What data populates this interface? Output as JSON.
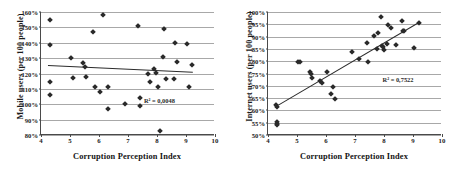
{
  "figure": {
    "panels": [
      {
        "id": "mobile",
        "ylabel": "Mobile users (per 100 people)",
        "xlabel": "Corruption Perception Index",
        "r2_label": "R² = 0,0048"
      },
      {
        "id": "internet",
        "ylabel": "Internet users (per 100 people)",
        "xlabel": "Corruption Perception Index",
        "r2_label": "R² = 0,7522"
      }
    ]
  },
  "chart_data": [
    {
      "type": "scatter",
      "title": "",
      "xlabel": "Corruption Perception Index",
      "ylabel": "Mobile users (per 100 people)",
      "xlim": [
        4,
        10
      ],
      "ylim": [
        0.8,
        1.6
      ],
      "xticks": [
        4,
        5,
        6,
        7,
        8,
        9,
        10
      ],
      "yticks": [
        0.8,
        0.9,
        1.0,
        1.1,
        1.2,
        1.3,
        1.4,
        1.5,
        1.6
      ],
      "ytick_labels": [
        "80%",
        "90%",
        "100%",
        "110%",
        "120%",
        "130%",
        "140%",
        "150%",
        "160%"
      ],
      "xtick_labels": [
        "4",
        "5",
        "6",
        "7",
        "8",
        "9",
        "10"
      ],
      "grid": "horizontal",
      "legend": "none",
      "annotations": [
        {
          "text": "R² = 0,0048",
          "x": 7.55,
          "y": 1.045
        }
      ],
      "trendline": {
        "type": "linear",
        "x": [
          4.25,
          9.25
        ],
        "y": [
          1.253,
          1.209
        ],
        "r2": 0.0048
      },
      "points": [
        {
          "x": 4.3,
          "y": 1.545
        },
        {
          "x": 4.3,
          "y": 1.385
        },
        {
          "x": 4.3,
          "y": 1.147
        },
        {
          "x": 4.3,
          "y": 1.062
        },
        {
          "x": 5.05,
          "y": 1.302
        },
        {
          "x": 5.1,
          "y": 1.168
        },
        {
          "x": 5.45,
          "y": 1.268
        },
        {
          "x": 5.5,
          "y": 1.243
        },
        {
          "x": 5.55,
          "y": 1.18
        },
        {
          "x": 5.8,
          "y": 1.468
        },
        {
          "x": 5.85,
          "y": 1.115
        },
        {
          "x": 6.05,
          "y": 1.082
        },
        {
          "x": 6.15,
          "y": 1.58
        },
        {
          "x": 6.3,
          "y": 1.112
        },
        {
          "x": 6.3,
          "y": 0.967
        },
        {
          "x": 6.9,
          "y": 1.002
        },
        {
          "x": 7.35,
          "y": 1.512
        },
        {
          "x": 7.4,
          "y": 1.04
        },
        {
          "x": 7.4,
          "y": 0.988
        },
        {
          "x": 7.7,
          "y": 1.2
        },
        {
          "x": 7.75,
          "y": 1.142
        },
        {
          "x": 7.9,
          "y": 1.227
        },
        {
          "x": 7.95,
          "y": 1.205
        },
        {
          "x": 8.05,
          "y": 1.11
        },
        {
          "x": 8.1,
          "y": 0.823
        },
        {
          "x": 8.2,
          "y": 1.305
        },
        {
          "x": 8.25,
          "y": 1.487
        },
        {
          "x": 8.3,
          "y": 1.163
        },
        {
          "x": 8.6,
          "y": 1.163
        },
        {
          "x": 8.62,
          "y": 1.398
        },
        {
          "x": 8.68,
          "y": 1.278
        },
        {
          "x": 9.05,
          "y": 1.393
        },
        {
          "x": 9.1,
          "y": 1.113
        },
        {
          "x": 9.2,
          "y": 1.257
        }
      ]
    },
    {
      "type": "scatter",
      "title": "",
      "xlabel": "Corruption Perception Index",
      "ylabel": "Internet users (per 100 people)",
      "xlim": [
        4,
        10
      ],
      "ylim": [
        0.5,
        1.0
      ],
      "xticks": [
        4,
        5,
        6,
        7,
        8,
        9,
        10
      ],
      "yticks": [
        0.5,
        0.55,
        0.6,
        0.65,
        0.7,
        0.75,
        0.8,
        0.85,
        0.9,
        0.95,
        1.0
      ],
      "ytick_labels": [
        "50%",
        "55%",
        "60%",
        "65%",
        "70%",
        "75%",
        "80%",
        "85%",
        "90%",
        "95%",
        "100%"
      ],
      "xtick_labels": [
        "4",
        "5",
        "6",
        "7",
        "8",
        "9",
        "10"
      ],
      "grid": "horizontal",
      "legend": "none",
      "annotations": [
        {
          "text": "R² = 0,7522",
          "x": 7.95,
          "y": 0.738
        }
      ],
      "trendline": {
        "type": "linear",
        "x": [
          4.28,
          9.2
        ],
        "y": [
          0.617,
          0.958
        ],
        "r2": 0.7522
      },
      "points": [
        {
          "x": 4.28,
          "y": 0.62
        },
        {
          "x": 4.3,
          "y": 0.612
        },
        {
          "x": 4.3,
          "y": 0.553
        },
        {
          "x": 4.3,
          "y": 0.545
        },
        {
          "x": 4.32,
          "y": 0.54
        },
        {
          "x": 5.05,
          "y": 0.797
        },
        {
          "x": 5.12,
          "y": 0.797
        },
        {
          "x": 5.45,
          "y": 0.757
        },
        {
          "x": 5.48,
          "y": 0.748
        },
        {
          "x": 5.52,
          "y": 0.731
        },
        {
          "x": 5.8,
          "y": 0.718
        },
        {
          "x": 5.85,
          "y": 0.713
        },
        {
          "x": 6.05,
          "y": 0.757
        },
        {
          "x": 6.18,
          "y": 0.667
        },
        {
          "x": 6.25,
          "y": 0.695
        },
        {
          "x": 6.3,
          "y": 0.645
        },
        {
          "x": 6.9,
          "y": 0.838
        },
        {
          "x": 7.15,
          "y": 0.808
        },
        {
          "x": 7.4,
          "y": 0.873
        },
        {
          "x": 7.45,
          "y": 0.797
        },
        {
          "x": 7.65,
          "y": 0.903
        },
        {
          "x": 7.75,
          "y": 0.848
        },
        {
          "x": 7.8,
          "y": 0.915
        },
        {
          "x": 7.9,
          "y": 0.978
        },
        {
          "x": 7.92,
          "y": 0.862
        },
        {
          "x": 7.95,
          "y": 0.857
        },
        {
          "x": 8.0,
          "y": 0.845
        },
        {
          "x": 8.1,
          "y": 0.868
        },
        {
          "x": 8.15,
          "y": 0.948
        },
        {
          "x": 8.25,
          "y": 0.933
        },
        {
          "x": 8.4,
          "y": 0.867
        },
        {
          "x": 8.62,
          "y": 0.962
        },
        {
          "x": 8.65,
          "y": 0.922
        },
        {
          "x": 8.7,
          "y": 0.922
        },
        {
          "x": 9.05,
          "y": 0.852
        },
        {
          "x": 9.2,
          "y": 0.957
        }
      ]
    }
  ]
}
